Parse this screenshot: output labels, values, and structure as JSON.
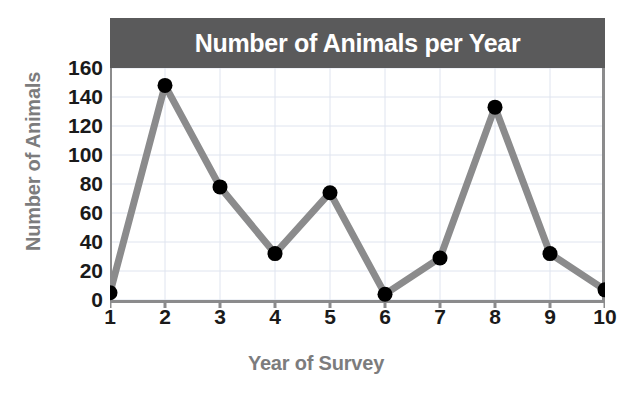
{
  "chart_data": {
    "type": "line",
    "title": "Number of Animals per Year",
    "xlabel": "Year of Survey",
    "ylabel": "Number of Animals",
    "categories": [
      1,
      2,
      3,
      4,
      5,
      6,
      7,
      8,
      9,
      10
    ],
    "x_tick_labels": [
      "1",
      "2",
      "3",
      "4",
      "5",
      "6",
      "7",
      "8",
      "9",
      "10"
    ],
    "values": [
      5,
      148,
      78,
      32,
      74,
      4,
      29,
      133,
      32,
      7
    ],
    "y_tick_labels": [
      "0",
      "20",
      "40",
      "60",
      "80",
      "100",
      "120",
      "140",
      "160"
    ],
    "y_ticks": [
      0,
      20,
      40,
      60,
      80,
      100,
      120,
      140,
      160
    ],
    "ylim": [
      0,
      160
    ],
    "xlim": [
      1,
      10
    ],
    "grid": true,
    "legend": "none",
    "markers": "filled-circle",
    "colors": {
      "title_bar_background": "#5a5a5b",
      "title_text": "#ffffff",
      "line": "#8b8b8c",
      "marker": "#000000",
      "axis": "#8b8b8c",
      "tick_label": "#1a1a1a",
      "axis_title": "#7c7c7d",
      "gridline": "#dfe4ef",
      "plot_background": "#ffffff"
    }
  }
}
